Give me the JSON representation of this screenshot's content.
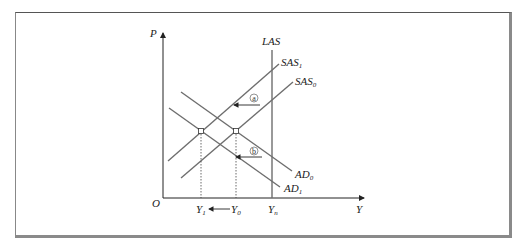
{
  "diagram": {
    "type": "AD-AS model",
    "axes": {
      "y_label": "P",
      "x_label": "Y",
      "origin_label": "O"
    },
    "curves": [
      {
        "id": "LAS",
        "label": "LAS",
        "sub": ""
      },
      {
        "id": "SAS1",
        "label": "SAS",
        "sub": "1"
      },
      {
        "id": "SAS0",
        "label": "SAS",
        "sub": "0"
      },
      {
        "id": "AD0",
        "label": "AD",
        "sub": "0"
      },
      {
        "id": "AD1",
        "label": "AD",
        "sub": "1"
      }
    ],
    "x_ticks": [
      {
        "label": "Y",
        "sub": "1"
      },
      {
        "label": "Y",
        "sub": "0"
      },
      {
        "label": "Y",
        "sub": "n"
      }
    ],
    "shift_markers": [
      {
        "label": "a",
        "describes": "SAS0 shifts left to SAS1"
      },
      {
        "label": "b",
        "describes": "AD0 shifts left to AD1"
      }
    ],
    "colors": {
      "curve": "#6e6e6e",
      "axis": "#222222",
      "frame_shadow": "#8a8a8a"
    }
  }
}
